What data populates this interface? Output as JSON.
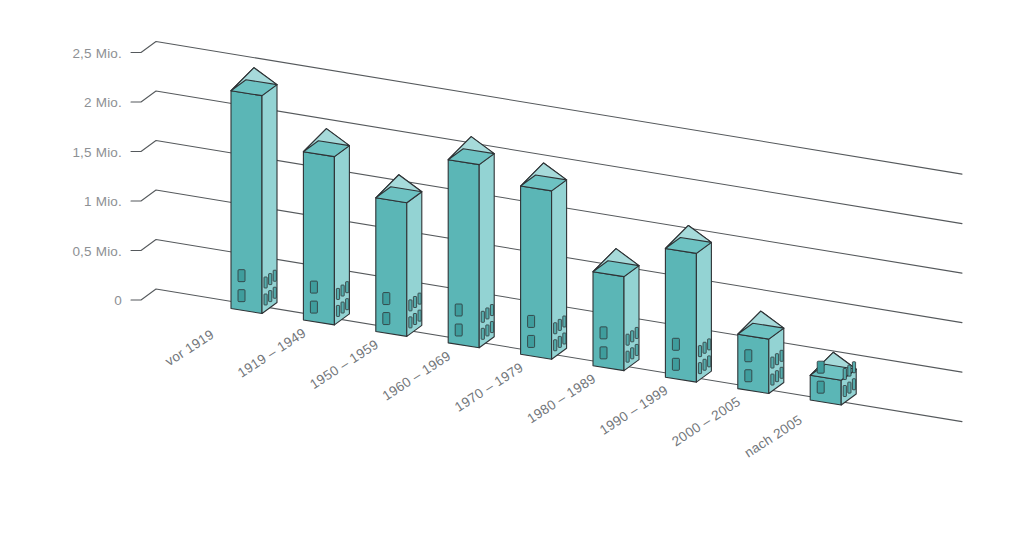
{
  "chart_data": {
    "type": "bar",
    "title": "",
    "subtitle": "",
    "xlabel": "",
    "ylabel": "",
    "unit_note": "Mio.",
    "grid": true,
    "legend": null,
    "projection": "isometric-3d-buildings",
    "ylim": [
      0,
      2.5
    ],
    "ytick_labels": [
      "2,5 Mio.",
      "2 Mio.",
      "1,5 Mio.",
      "1 Mio.",
      "0,5 Mio.",
      "0"
    ],
    "ytick_values": [
      2.5,
      2.0,
      1.5,
      1.0,
      0.5,
      0
    ],
    "categories": [
      "vor 1919",
      "1919 – 1949",
      "1950 – 1959",
      "1960 – 1969",
      "1970 – 1979",
      "1980 – 1989",
      "1990 – 1999",
      "2000 – 2005",
      "nach 2005"
    ],
    "values": [
      2.2,
      1.7,
      1.35,
      1.85,
      1.7,
      0.95,
      1.3,
      0.55,
      0.25
    ],
    "colors": {
      "bar_front": "#5bb6b6",
      "bar_side": "#93d3d3",
      "roof_front": "#6dc2c2",
      "roof_side": "#a6dada",
      "outline": "#2f3336",
      "gridline": "#55595c",
      "ytick_text": "#8d9094",
      "xtick_text": "#72767a",
      "background": "#ffffff"
    }
  }
}
